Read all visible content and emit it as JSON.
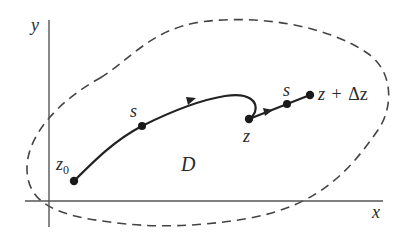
{
  "diagram": {
    "type": "complex-plane path diagram",
    "axes": {
      "x_label": "x",
      "y_label": "y"
    },
    "region": {
      "label": "D",
      "boundary_style": "dashed"
    },
    "points": {
      "start": {
        "label": "z",
        "subscript": "0"
      },
      "s1": {
        "label": "s"
      },
      "z": {
        "label": "z"
      },
      "s2": {
        "label": "s"
      },
      "end": {
        "label_z": "z",
        "label_plus": "+",
        "label_delta": "Δz"
      }
    },
    "colors": {
      "ink": "#2a2a2a",
      "axis": "#555555",
      "dash": "#444444",
      "background": "#ffffff"
    }
  }
}
